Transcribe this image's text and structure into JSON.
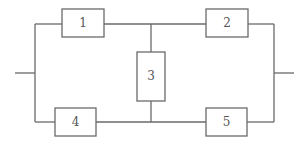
{
  "diagram": {
    "type": "reliability-block-diagram",
    "line_color": "#6a6a6a",
    "blocks": [
      {
        "id": "1",
        "label": "1",
        "x": 62,
        "y": 9,
        "w": 42,
        "h": 28
      },
      {
        "id": "2",
        "label": "2",
        "x": 206,
        "y": 9,
        "w": 42,
        "h": 28
      },
      {
        "id": "3",
        "label": "3",
        "x": 137,
        "y": 52,
        "w": 28,
        "h": 49
      },
      {
        "id": "4",
        "label": "4",
        "x": 55,
        "y": 108,
        "w": 41,
        "h": 28
      },
      {
        "id": "5",
        "label": "5",
        "x": 206,
        "y": 108,
        "w": 41,
        "h": 28
      }
    ],
    "connections": [
      {
        "from": "input",
        "to": "1"
      },
      {
        "from": "input",
        "to": "4"
      },
      {
        "from": "1",
        "to": "2"
      },
      {
        "from": "4",
        "to": "5"
      },
      {
        "from": "1-2 junction",
        "to": "3"
      },
      {
        "from": "3",
        "to": "4-5 junction"
      },
      {
        "from": "2",
        "to": "output"
      },
      {
        "from": "5",
        "to": "output"
      }
    ]
  }
}
